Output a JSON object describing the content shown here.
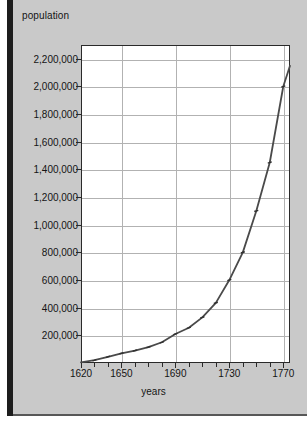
{
  "chart_data": {
    "type": "line",
    "title": "",
    "ylabel": "population",
    "xlabel": "years",
    "grid": true,
    "legend": "none",
    "xlim": [
      1620,
      1775
    ],
    "ylim": [
      0,
      2300000
    ],
    "x_ticks": [
      1620,
      1650,
      1690,
      1730,
      1770
    ],
    "x_tick_labels": [
      "1620",
      "1650",
      "1690",
      "1730",
      "1770"
    ],
    "x_minor_ticks": [
      1630,
      1640,
      1660,
      1670,
      1680,
      1700,
      1710,
      1720,
      1740,
      1750,
      1760
    ],
    "y_ticks": [
      200000,
      400000,
      600000,
      800000,
      1000000,
      1200000,
      1400000,
      1600000,
      1800000,
      2000000,
      2200000
    ],
    "y_tick_labels": [
      "200,000",
      "400,000",
      "600,000",
      "800,000",
      "1,000,000",
      "1,200,000",
      "1,400,000",
      "1,600,000",
      "1,800,000",
      "2,000,000",
      "2,200,000"
    ],
    "series": [
      {
        "name": "population",
        "x": [
          1620,
          1630,
          1640,
          1650,
          1660,
          1670,
          1680,
          1690,
          1700,
          1710,
          1720,
          1730,
          1740,
          1750,
          1760,
          1770,
          1775
        ],
        "values": [
          5000,
          20000,
          45000,
          70000,
          90000,
          115000,
          150000,
          210000,
          255000,
          330000,
          435000,
          600000,
          800000,
          1100000,
          1450000,
          2000000,
          2150000
        ],
        "color": "#4a4a4a",
        "marker": "tick"
      }
    ]
  },
  "page": {
    "background_color": "#c9c9c9",
    "plot_background_color": "#ffffff",
    "axis_color": "#2a2a2a",
    "grid_color": "#b2b2b2"
  }
}
